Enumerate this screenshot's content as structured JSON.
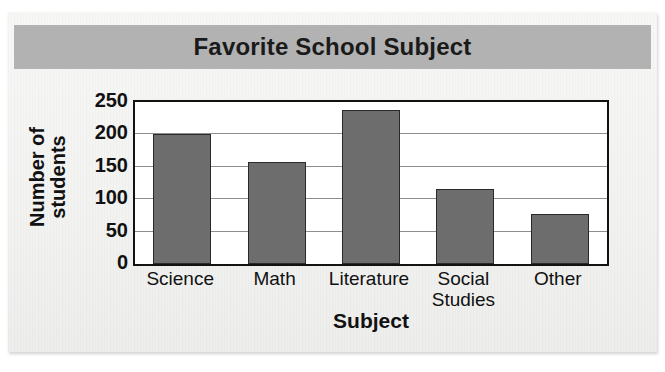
{
  "chart_data": {
    "type": "bar",
    "title": "Favorite School Subject",
    "xlabel": "Subject",
    "ylabel": "Number of\nstudents",
    "ylabel_lines": [
      "Number of",
      "students"
    ],
    "categories": [
      "Science",
      "Math",
      "Literature",
      "Social\nStudies",
      "Other"
    ],
    "category_lines": [
      [
        "Science"
      ],
      [
        "Math"
      ],
      [
        "Literature"
      ],
      [
        "Social",
        "Studies"
      ],
      [
        "Other"
      ]
    ],
    "values": [
      200,
      158,
      238,
      116,
      77
    ],
    "ylim": [
      0,
      250
    ],
    "yticks": [
      0,
      50,
      100,
      150,
      200,
      250
    ],
    "ytick_labels": [
      "0",
      "50",
      "100",
      "150",
      "200",
      "250"
    ],
    "grid": true,
    "grid_axis": "y",
    "legend": false,
    "bar_color": "#6d6d6d",
    "bar_edge_color": "#2a2a2a",
    "gridline_color": "#8e8e8e",
    "axis_color": "#121212",
    "title_band_color": "#b2b2b2",
    "plot_background": "#ffffff",
    "page_background": "#f2f2f1"
  }
}
